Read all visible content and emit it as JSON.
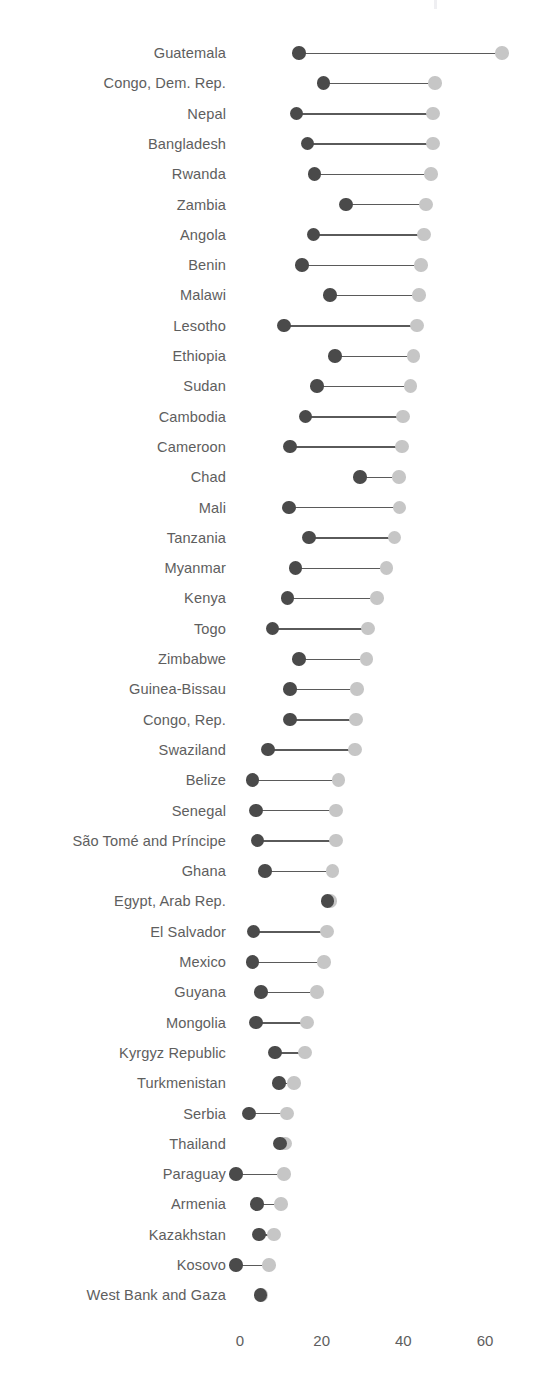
{
  "chart_data": {
    "type": "dumbbell",
    "title": "",
    "subtitle": "",
    "xlabel": "",
    "ylabel": "",
    "xlim": [
      -2,
      68
    ],
    "grid": false,
    "legend": "none",
    "series": [
      {
        "name": "start",
        "color": "#4a4a4a"
      },
      {
        "name": "end",
        "color": "#c6c6c6"
      }
    ],
    "categories": [
      "Guatemala",
      "Congo, Dem. Rep.",
      "Nepal",
      "Bangladesh",
      "Rwanda",
      "Zambia",
      "Angola",
      "Benin",
      "Malawi",
      "Lesotho",
      "Ethiopia",
      "Sudan",
      "Cambodia",
      "Cameroon",
      "Chad",
      "Mali",
      "Tanzania",
      "Myanmar",
      "Kenya",
      "Togo",
      "Zimbabwe",
      "Guinea-Bissau",
      "Congo, Rep.",
      "Swaziland",
      "Belize",
      "Senegal",
      "São Tomé and Príncipe",
      "Ghana",
      "Egypt, Arab Rep.",
      "El Salvador",
      "Mexico",
      "Guyana",
      "Mongolia",
      "Kyrgyz Republic",
      "Turkmenistan",
      "Serbia",
      "Thailand",
      "Paraguay",
      "Armenia",
      "Kazakhstan",
      "Kosovo",
      "West Bank and Gaza"
    ],
    "start_values": [
      14.5,
      20.5,
      13.8,
      16.5,
      18.3,
      26.0,
      18.0,
      15.2,
      22.0,
      10.8,
      23.3,
      18.8,
      16.1,
      12.2,
      29.4,
      12.0,
      16.9,
      13.6,
      11.6,
      8.0,
      14.5,
      12.2,
      12.2,
      6.9,
      3.1,
      3.9,
      4.3,
      6.1,
      21.4,
      3.3,
      3.1,
      5.1,
      3.9,
      8.6,
      9.6,
      2.2,
      9.8,
      -1.0,
      4.2,
      4.7,
      -1.0,
      5.0
    ],
    "end_values": [
      64.2,
      47.8,
      47.3,
      47.3,
      46.8,
      45.5,
      45.1,
      44.3,
      43.8,
      43.3,
      42.5,
      41.8,
      39.9,
      39.7,
      38.9,
      39.1,
      37.9,
      35.9,
      33.6,
      31.3,
      31.0,
      28.6,
      28.4,
      28.2,
      24.1,
      23.5,
      23.5,
      22.7,
      22.2,
      21.3,
      20.6,
      18.8,
      16.4,
      15.9,
      13.2,
      11.5,
      11.0,
      10.8,
      10.0,
      8.3,
      7.1,
      5.3
    ],
    "xticks": [
      0,
      20,
      40,
      60
    ],
    "xtick_labels": [
      "0",
      "20",
      "40",
      "60"
    ]
  },
  "layout": {
    "x_zero_px": 240,
    "px_per_unit": 4.083,
    "first_row_center_y": 53,
    "row_step_px": 30.3,
    "dot_diameter_px": 13.5
  }
}
